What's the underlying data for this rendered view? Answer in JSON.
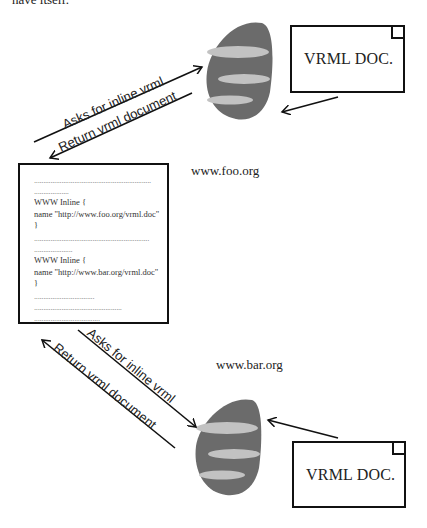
{
  "caption_fragment": "have itself.",
  "top_server": {
    "host_label": "www.foo.org",
    "document_label": "VRML DOC.",
    "request_label": "Asks for inline vrml",
    "response_label": "Return vrml document"
  },
  "bottom_server": {
    "host_label": "www.bar.org",
    "document_label": "VRML DOC.",
    "request_label": "Asks for inline vrml",
    "response_label": "Return vrml document"
  },
  "client_document": {
    "lines": [
      {
        "type": "dots",
        "text": "................................................................"
      },
      {
        "type": "dots",
        "text": "..................."
      },
      {
        "type": "code",
        "text": "WWW Inline {"
      },
      {
        "type": "code",
        "text": "name \"http://www.foo.org/vrml.doc\""
      },
      {
        "type": "code",
        "text": "}"
      },
      {
        "type": "dots",
        "text": "..............................................................."
      },
      {
        "type": "dots",
        "text": "....................."
      },
      {
        "type": "code",
        "text": "WWW Inline {"
      },
      {
        "type": "code",
        "text": "name \"http://www.bar.org/vrml.doc\""
      },
      {
        "type": "code",
        "text": "}"
      },
      {
        "type": "dots",
        "text": "................................."
      },
      {
        "type": "dots",
        "text": "................................................"
      },
      {
        "type": "dots",
        "text": "...................................."
      }
    ]
  },
  "colors": {
    "server_body": "#6b6b6b",
    "server_bands": "#c2c2c2",
    "stroke": "#111111"
  }
}
